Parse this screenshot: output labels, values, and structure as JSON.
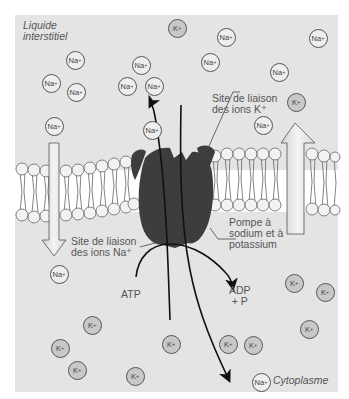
{
  "labels": {
    "extracellular": [
      "Liquide",
      "interstitiel"
    ],
    "cytoplasm": "Cytoplasme",
    "k_site": [
      "Site de liaison",
      "des ions K⁺"
    ],
    "na_site": [
      "Site de liaison",
      "des ions Na⁺"
    ],
    "pump": [
      "Pompe à",
      "sodium et à",
      "potassium"
    ],
    "atp": "ATP",
    "adp": [
      "ADP",
      "+ P"
    ]
  },
  "ions": {
    "na_symbol": "Na",
    "k_symbol": "K",
    "charge": "+",
    "na_positions": [
      [
        75,
        60
      ],
      [
        51,
        83
      ],
      [
        76,
        92
      ],
      [
        141,
        65
      ],
      [
        127,
        86
      ],
      [
        154,
        86
      ],
      [
        226,
        37
      ],
      [
        318,
        38
      ],
      [
        210,
        62
      ],
      [
        279,
        72
      ],
      [
        263,
        125
      ],
      [
        54,
        126
      ],
      [
        152,
        130
      ],
      [
        59,
        274
      ],
      [
        261,
        382
      ]
    ],
    "k_positions": [
      [
        177,
        28
      ],
      [
        296,
        102
      ],
      [
        294,
        283
      ],
      [
        325,
        292
      ],
      [
        309,
        329
      ],
      [
        92,
        325
      ],
      [
        60,
        348
      ],
      [
        77,
        370
      ],
      [
        135,
        376
      ],
      [
        171,
        344
      ],
      [
        228,
        344
      ],
      [
        253,
        345
      ]
    ]
  },
  "colors": {
    "background_panel": "#e4e4e4",
    "pump_protein": "#3d3d3d",
    "arrow_fill": "#e9e9e9",
    "lipid_head": "#f2f2f2"
  }
}
